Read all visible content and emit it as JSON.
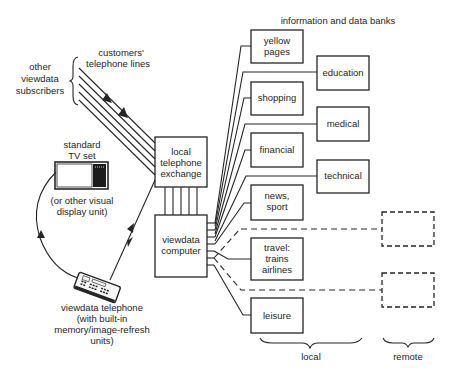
{
  "diagram": {
    "header": "information and data banks",
    "subscribers": {
      "label_lines": [
        "other",
        "viewdata",
        "subscribers"
      ],
      "phone_lines_label_lines": [
        "customers'",
        "telephone lines"
      ]
    },
    "tv": {
      "title_lines": [
        "standard",
        "TV set"
      ],
      "alt_lines": [
        "(or other visual",
        "display unit)"
      ]
    },
    "exchange": {
      "label_lines": [
        "local",
        "telephone",
        "exchange"
      ]
    },
    "computer": {
      "label_lines": [
        "viewdata",
        "computer"
      ]
    },
    "telephone": {
      "label_lines": [
        "viewdata telephone",
        "(with built-in",
        "memory/image-refresh",
        "units)"
      ]
    },
    "data_banks": {
      "local": [
        {
          "id": "yellow-pages",
          "label_lines": [
            "yellow",
            "pages"
          ]
        },
        {
          "id": "education",
          "label_lines": [
            "education"
          ]
        },
        {
          "id": "shopping",
          "label_lines": [
            "shopping"
          ]
        },
        {
          "id": "medical",
          "label_lines": [
            "medical"
          ]
        },
        {
          "id": "financial",
          "label_lines": [
            "financial"
          ]
        },
        {
          "id": "technical",
          "label_lines": [
            "technical"
          ]
        },
        {
          "id": "news-sport",
          "label_lines": [
            "news,",
            "sport"
          ]
        },
        {
          "id": "travel",
          "label_lines": [
            "travel:",
            "trains",
            "airlines"
          ]
        },
        {
          "id": "leisure",
          "label_lines": [
            "leisure"
          ]
        }
      ],
      "remote_count": 2
    },
    "brace_labels": {
      "local": "local",
      "remote": "remote"
    }
  }
}
